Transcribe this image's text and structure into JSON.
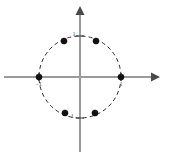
{
  "figure": {
    "width": 170,
    "height": 156,
    "background_color": "#ffffff"
  },
  "axes": {
    "x_axis": {
      "label": "",
      "color": "#9a9a9a",
      "arrow": "right",
      "x_start": 4,
      "x_end": 160,
      "y": 77
    },
    "y_axis": {
      "label": "",
      "color": "#9a9a9a",
      "arrow": "up",
      "y_start": 6,
      "y_end": 152,
      "x": 80
    },
    "origin": {
      "x": 80,
      "y": 77
    }
  },
  "ticks": [
    {
      "name": "tick-y-positive-one",
      "label": "1",
      "axis": "y",
      "value": 1,
      "px_x": 80,
      "px_y": 36,
      "label_x": 74,
      "label_y": 36
    },
    {
      "name": "tick-y-negative-one",
      "label": "-1",
      "axis": "y",
      "value": -1,
      "px_x": 80,
      "px_y": 118,
      "label_x": 71,
      "label_y": 118
    },
    {
      "name": "tick-x-negative-one",
      "label": "-1",
      "axis": "x",
      "value": -1,
      "px_x": 39,
      "px_y": 77,
      "label_x": 39,
      "label_y": 86
    },
    {
      "name": "tick-x-positive-one",
      "label": "1",
      "axis": "x",
      "value": 1,
      "px_x": 121,
      "px_y": 77,
      "label_x": 121,
      "label_y": 86
    }
  ],
  "chart_data": {
    "type": "scatter",
    "title": "",
    "subtitle": "",
    "xlabel": "",
    "ylabel": "",
    "xlim": [
      -2,
      2
    ],
    "ylim": [
      -2,
      2
    ],
    "grid": false,
    "legend": "none",
    "annotations": [],
    "circle": {
      "name": "unit-circle",
      "center_x": 0,
      "center_y": 0,
      "radius": 1,
      "style": "dashed",
      "color": "#2b2b2b",
      "px_center_x": 80,
      "px_center_y": 77,
      "px_radius": 41
    },
    "series": [
      {
        "name": "sixth roots of unity",
        "marker": "filled-circle",
        "color": "#111111",
        "points": [
          {
            "label": "1",
            "x": 1.0,
            "y": 0.0,
            "px_x": 121,
            "px_y": 77
          },
          {
            "label": "1/2+i√3/2",
            "x": 0.5,
            "y": 0.866,
            "px_x": 96,
            "px_y": 41
          },
          {
            "label": "-1/2+i√3/2",
            "x": -0.5,
            "y": 0.866,
            "px_x": 64,
            "px_y": 41
          },
          {
            "label": "-1",
            "x": -1.0,
            "y": 0.0,
            "px_x": 39,
            "px_y": 77
          },
          {
            "label": "-1/2-i√3/2",
            "x": -0.5,
            "y": -0.866,
            "px_x": 65,
            "px_y": 113
          },
          {
            "label": "1/2-i√3/2",
            "x": 0.5,
            "y": -0.866,
            "px_x": 95,
            "px_y": 113
          }
        ]
      }
    ]
  }
}
